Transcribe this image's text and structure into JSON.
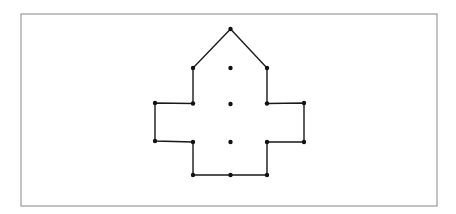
{
  "figure": {
    "type": "line-drawing",
    "canvas": {
      "width": 456,
      "height": 214,
      "background": "#ffffff"
    },
    "frame": {
      "name": "outer-border",
      "x": 21,
      "y": 14,
      "width": 416,
      "height": 192,
      "stroke": "#9a9a9a",
      "stroke_width": 1.2,
      "fill": "none"
    },
    "shape": {
      "name": "cross-house-polygon",
      "stroke": "#1a1a1a",
      "stroke_width": 1.4,
      "fill": "none",
      "closed": true,
      "points": [
        {
          "label": "apex",
          "x": 230.5,
          "y": 29
        },
        {
          "label": "right-eave",
          "x": 267,
          "y": 68
        },
        {
          "label": "right-body-upper",
          "x": 267,
          "y": 103.5
        },
        {
          "label": "right-arm-top-outer",
          "x": 304,
          "y": 103
        },
        {
          "label": "right-arm-bottom-outer",
          "x": 304,
          "y": 142
        },
        {
          "label": "right-body-lower",
          "x": 267,
          "y": 142
        },
        {
          "label": "right-base",
          "x": 267,
          "y": 175
        },
        {
          "label": "left-base",
          "x": 193,
          "y": 175
        },
        {
          "label": "left-body-lower",
          "x": 193,
          "y": 142
        },
        {
          "label": "left-arm-bottom-outer",
          "x": 155,
          "y": 141
        },
        {
          "label": "left-arm-top-outer",
          "x": 155,
          "y": 103
        },
        {
          "label": "left-body-upper",
          "x": 193,
          "y": 103.5
        },
        {
          "label": "left-eave",
          "x": 193,
          "y": 68
        }
      ]
    },
    "vertex_markers": {
      "name": "vertex-dots",
      "fill": "#111111",
      "radius": 2.2,
      "points": [
        {
          "label": "apex",
          "x": 230.5,
          "y": 29
        },
        {
          "label": "left-eave",
          "x": 193,
          "y": 68
        },
        {
          "label": "right-eave",
          "x": 267,
          "y": 68
        },
        {
          "label": "left-body-upper",
          "x": 193,
          "y": 103.5
        },
        {
          "label": "right-body-upper",
          "x": 267,
          "y": 103.5
        },
        {
          "label": "left-arm-top-outer",
          "x": 155,
          "y": 103
        },
        {
          "label": "right-arm-top-outer",
          "x": 304,
          "y": 103
        },
        {
          "label": "left-arm-bottom-outer",
          "x": 155,
          "y": 141
        },
        {
          "label": "right-arm-bottom-outer",
          "x": 304,
          "y": 142
        },
        {
          "label": "left-body-lower",
          "x": 193,
          "y": 142
        },
        {
          "label": "right-body-lower",
          "x": 267,
          "y": 142
        },
        {
          "label": "left-base",
          "x": 193,
          "y": 175
        },
        {
          "label": "right-base",
          "x": 267,
          "y": 175
        }
      ]
    },
    "interior_markers": {
      "name": "centerline-dots",
      "fill": "#111111",
      "radius": 2.2,
      "points": [
        {
          "label": "center-upper",
          "x": 230.5,
          "y": 68
        },
        {
          "label": "center-middle",
          "x": 230.5,
          "y": 104
        },
        {
          "label": "center-lower",
          "x": 230.5,
          "y": 142
        },
        {
          "label": "center-base",
          "x": 230.5,
          "y": 175
        }
      ]
    }
  }
}
